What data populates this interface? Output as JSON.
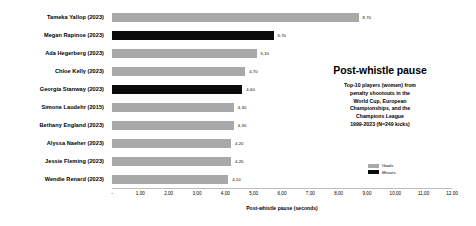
{
  "chart_data": {
    "type": "bar",
    "orientation": "horizontal",
    "title": "Post-whistle pause",
    "subtitle": "Top-10 players (women) from penalty shootouts in the World Cup, European Championships, and the Champions League 1999-2023 (N=249 kicks)",
    "subtitle_lines": [
      "Top-10 players (women) from",
      "penalty shootouts in the",
      "World Cup, European",
      "Championships, and the",
      "Champions League",
      "1999-2023 (N=249 kicks)"
    ],
    "xlabel": "Post-whistle pause (seconds)",
    "ylabel": "",
    "xlim": [
      0,
      12
    ],
    "grid": false,
    "legend_position": "right",
    "categories": [
      "Tameka Yallop (2023)",
      "Megan Rapinoe (2023)",
      "Ada Hegerberg (2023)",
      "Chloe Kelly (2023)",
      "Georgia Stanway (2023)",
      "Simone Laudehr (2015)",
      "Bethany England (2023)",
      "Alyssa Naeher (2023)",
      "Jessie Fleming (2023)",
      "Wendie Renard (2023)"
    ],
    "values": [
      8.7,
      5.7,
      5.1,
      4.7,
      4.6,
      4.3,
      4.3,
      4.2,
      4.2,
      4.1
    ],
    "value_labels": [
      "8,70",
      "5,70",
      "5,10",
      "4,70",
      "4,60",
      "4,30",
      "4,30",
      "4,20",
      "4,20",
      "4,10"
    ],
    "outcomes": [
      "goal",
      "miss",
      "goal",
      "goal",
      "miss",
      "goal",
      "goal",
      "goal",
      "goal",
      "goal"
    ],
    "xticks": [
      0,
      1,
      2,
      3,
      4,
      5,
      6,
      7,
      8,
      9,
      10,
      11,
      12
    ],
    "xtick_labels": [
      "-",
      "1,00",
      "2,00",
      "3,00",
      "4,00",
      "5,00",
      "6,00",
      "7,00",
      "8,00",
      "9,00",
      "10,00",
      "11,00",
      "12,00"
    ],
    "legend": [
      {
        "label": "Goals",
        "color": "#a8a8a8"
      },
      {
        "label": "Misses",
        "color": "#0b0b0b"
      }
    ],
    "colors": {
      "goal": "#a8a8a8",
      "miss": "#0b0b0b",
      "background": "#ffffff",
      "text": "#000000",
      "axis": "#bdbdbd"
    }
  }
}
